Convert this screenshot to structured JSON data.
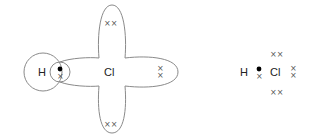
{
  "diagram": {
    "title": "",
    "left": {
      "type": "overlapping-orbitals",
      "atoms": [
        "H",
        "Cl"
      ],
      "h_label": "H",
      "cl_label": "Cl",
      "shared_pair": {
        "h_electron": "●",
        "cl_electron": "×"
      },
      "lone_pairs": {
        "top": "××",
        "right": [
          "×",
          "×"
        ],
        "bottom": "××"
      }
    },
    "right": {
      "type": "dot-and-cross",
      "h_label": "H",
      "cl_label": "Cl",
      "shared_pair": {
        "h_electron": "●",
        "cl_electron": "×"
      },
      "lone_pairs": {
        "top": "××",
        "right": [
          "×",
          "×"
        ],
        "bottom": "××"
      }
    },
    "colors": {
      "outline": "#8a8a8a",
      "text": "#222222",
      "dot": "#000000"
    }
  }
}
